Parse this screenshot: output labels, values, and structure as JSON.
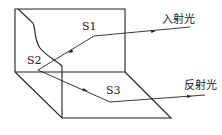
{
  "diagram": {
    "labels": {
      "s1": "S1",
      "s2": "S2",
      "s3": "S3",
      "incident": "入射光",
      "reflected": "反射光"
    },
    "colors": {
      "line": "#222222",
      "background": "#ffffff"
    }
  }
}
